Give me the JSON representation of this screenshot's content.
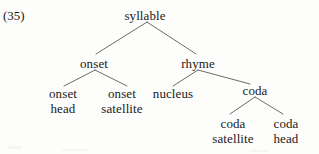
{
  "figure": {
    "example_number": "(35)",
    "background_color": "#fdfdfc",
    "text_color": "#1a1a1a",
    "line_color": "#5a5a58",
    "width": 319,
    "height": 154
  },
  "tree": {
    "root": {
      "id": "syllable",
      "label": "syllable",
      "line2": "",
      "x": 145,
      "y": 15
    },
    "nodes": [
      {
        "id": "onset",
        "label": "onset",
        "line2": "",
        "x": 94,
        "y": 63
      },
      {
        "id": "rhyme",
        "label": "rhyme",
        "line2": "",
        "x": 198,
        "y": 63
      },
      {
        "id": "onset-head",
        "label": "onset",
        "line2": "head",
        "x": 63,
        "y": 93
      },
      {
        "id": "onset-satellite",
        "label": "onset",
        "line2": "satellite",
        "x": 122,
        "y": 93
      },
      {
        "id": "nucleus",
        "label": "nucleus",
        "line2": "",
        "x": 173,
        "y": 93
      },
      {
        "id": "coda",
        "label": "coda",
        "line2": "",
        "x": 255,
        "y": 90
      },
      {
        "id": "coda-satellite",
        "label": "coda",
        "line2": "satellite",
        "x": 233,
        "y": 123
      },
      {
        "id": "coda-head",
        "label": "coda",
        "line2": "head",
        "x": 286,
        "y": 123
      }
    ],
    "edges": [
      {
        "id": "syllable-onset",
        "from": "syllable",
        "to": "onset",
        "x1": 147,
        "y1": 22,
        "x2": 96,
        "y2": 54
      },
      {
        "id": "syllable-rhyme",
        "from": "syllable",
        "to": "rhyme",
        "x1": 147,
        "y1": 22,
        "x2": 196,
        "y2": 54
      },
      {
        "id": "onset-onsethead",
        "from": "onset",
        "to": "onset-head",
        "x1": 95,
        "y1": 70,
        "x2": 64,
        "y2": 86
      },
      {
        "id": "onset-onsetsat",
        "from": "onset",
        "to": "onset-satellite",
        "x1": 95,
        "y1": 70,
        "x2": 127,
        "y2": 86
      },
      {
        "id": "rhyme-nucleus",
        "from": "rhyme",
        "to": "nucleus",
        "x1": 198,
        "y1": 70,
        "x2": 173,
        "y2": 86
      },
      {
        "id": "rhyme-coda",
        "from": "rhyme",
        "to": "coda",
        "x1": 198,
        "y1": 70,
        "x2": 250,
        "y2": 84
      },
      {
        "id": "coda-codasat",
        "from": "coda",
        "to": "coda-satellite",
        "x1": 255,
        "y1": 97,
        "x2": 230,
        "y2": 114
      },
      {
        "id": "coda-codahead",
        "from": "coda",
        "to": "coda-head",
        "x1": 255,
        "y1": 97,
        "x2": 283,
        "y2": 114
      }
    ]
  }
}
